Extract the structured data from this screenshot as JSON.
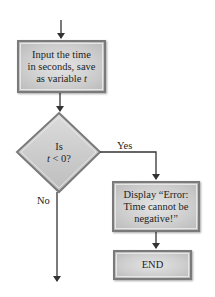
{
  "flowchart": {
    "nodes": {
      "input": {
        "shape": "rectangle",
        "lines": [
          "Input the time",
          "in seconds, save",
          "as variable "
        ],
        "variable": "t"
      },
      "decision": {
        "shape": "diamond",
        "line1": "Is",
        "line2_var": "t",
        "line2_rest": " < 0?"
      },
      "error": {
        "shape": "rectangle",
        "lines": [
          "Display “Error:",
          "Time cannot be",
          "negative!”"
        ]
      },
      "end": {
        "shape": "rectangle",
        "label": "END"
      }
    },
    "edges": {
      "yes_label": "Yes",
      "no_label": "No"
    },
    "colors": {
      "box_fill": "#cdcdcd",
      "box_border": "#7a7a7a",
      "arrow": "#333333"
    }
  }
}
